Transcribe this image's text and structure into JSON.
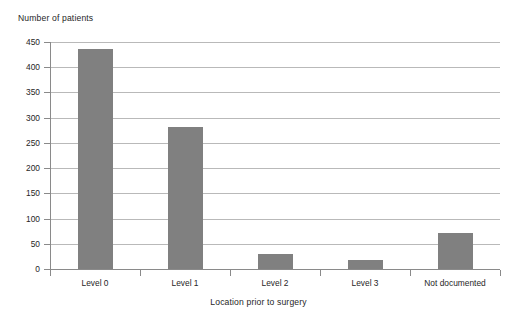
{
  "chart_data": {
    "type": "bar",
    "title": "",
    "categories": [
      "Level 0",
      "Level 1",
      "Level 2",
      "Level 3",
      "Not documented"
    ],
    "values": [
      437,
      281,
      30,
      18,
      72
    ],
    "series": [
      {
        "name": "Number of patients",
        "values": [
          437,
          281,
          30,
          18,
          72
        ]
      }
    ],
    "xlabel": "Location prior to surgery",
    "ylabel": "Number of patients",
    "ylim": [
      0,
      450
    ],
    "ytick_labels": [
      "0",
      "50",
      "100",
      "150",
      "200",
      "250",
      "300",
      "350",
      "400",
      "450"
    ],
    "ytick_values": [
      0,
      50,
      100,
      150,
      200,
      250,
      300,
      350,
      400,
      450
    ],
    "ytick_step": 50,
    "grid": true,
    "grid_axis": "y",
    "legend": false,
    "legend_position": "none",
    "bar_color": "#808080",
    "gridline_color": "#b9b9b9",
    "axis_color": "#8a8a8a",
    "background_color": "#ffffff",
    "text_color": "#262626"
  }
}
